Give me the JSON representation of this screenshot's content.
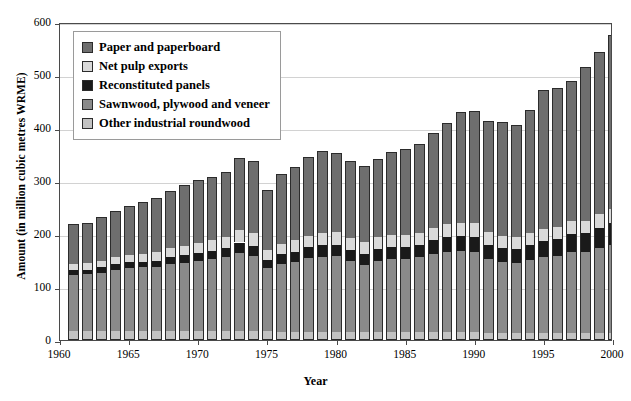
{
  "chart_data": {
    "type": "bar",
    "stacked": true,
    "title": "",
    "xlabel": "Year",
    "ylabel": "Amount (in million cubic metres WRME)",
    "ylim": [
      0,
      600
    ],
    "yticks": [
      0,
      100,
      200,
      300,
      400,
      500,
      600
    ],
    "xlim": [
      1960,
      2000
    ],
    "xticks": [
      1960,
      1965,
      1970,
      1975,
      1980,
      1985,
      1990,
      1995,
      2000
    ],
    "grid": true,
    "legend_position": "upper left",
    "legend_order_top_to_bottom": [
      "Paper and paperboard",
      "Net pulp exports",
      "Reconstituted panels",
      "Sawnwood, plywood and veneer",
      "Other industrial roundwood"
    ],
    "colors": {
      "Paper and paperboard": "#6e6e6e",
      "Net pulp exports": "#d9d9d9",
      "Reconstituted panels": "#1a1a1a",
      "Sawnwood, plywood and veneer": "#8a8a8a",
      "Other industrial roundwood": "#c2c2c2",
      "axis": "#4a4a4a",
      "grid": "#d2d2d2",
      "background": "#ffffff"
    },
    "categories": [
      1961,
      1962,
      1963,
      1964,
      1965,
      1966,
      1967,
      1968,
      1969,
      1970,
      1971,
      1972,
      1973,
      1974,
      1975,
      1976,
      1977,
      1978,
      1979,
      1980,
      1981,
      1982,
      1983,
      1984,
      1985,
      1986,
      1987,
      1988,
      1989,
      1990,
      1991,
      1992,
      1993,
      1994,
      1995,
      1996,
      1997,
      1998,
      1999,
      2000
    ],
    "series": [
      {
        "name": "Other industrial roundwood",
        "values": [
          17,
          17,
          17,
          17,
          17,
          17,
          17,
          17,
          17,
          17,
          17,
          17,
          17,
          17,
          17,
          16,
          16,
          16,
          16,
          16,
          16,
          16,
          15,
          15,
          15,
          15,
          15,
          15,
          15,
          15,
          14,
          14,
          14,
          14,
          14,
          14,
          14,
          14,
          14,
          14
        ]
      },
      {
        "name": "Sawnwood, plywood and veneer",
        "values": [
          106,
          107,
          110,
          116,
          119,
          120,
          121,
          126,
          129,
          132,
          135,
          140,
          148,
          142,
          118,
          128,
          132,
          138,
          141,
          142,
          133,
          126,
          134,
          138,
          138,
          141,
          147,
          152,
          153,
          151,
          139,
          133,
          131,
          137,
          142,
          145,
          152,
          152,
          160,
          166
        ]
      },
      {
        "name": "Reconstituted panels",
        "values": [
          9,
          9,
          10,
          10,
          11,
          11,
          12,
          13,
          14,
          15,
          16,
          17,
          19,
          19,
          16,
          18,
          19,
          21,
          22,
          22,
          21,
          20,
          22,
          23,
          23,
          24,
          26,
          28,
          29,
          29,
          27,
          27,
          27,
          29,
          31,
          32,
          34,
          35,
          38,
          41
        ]
      },
      {
        "name": "Net pulp exports",
        "values": [
          12,
          12,
          13,
          13,
          14,
          15,
          16,
          17,
          18,
          19,
          20,
          21,
          23,
          23,
          19,
          20,
          21,
          22,
          23,
          24,
          23,
          22,
          23,
          23,
          22,
          22,
          23,
          24,
          24,
          25,
          24,
          23,
          22,
          22,
          23,
          23,
          24,
          24,
          25,
          26
        ]
      },
      {
        "name": "Paper and paperboard",
        "values": [
          74,
          76,
          82,
          88,
          92,
          97,
          102,
          108,
          114,
          119,
          119,
          122,
          137,
          136,
          113,
          132,
          139,
          148,
          154,
          148,
          145,
          144,
          148,
          155,
          162,
          168,
          179,
          190,
          209,
          212,
          210,
          214,
          211,
          232,
          262,
          262,
          265,
          290,
          307,
          328
        ]
      }
    ],
    "totals": [
      218,
      221,
      232,
      244,
      253,
      260,
      268,
      281,
      292,
      303,
      307,
      317,
      344,
      337,
      283,
      314,
      327,
      345,
      356,
      352,
      338,
      328,
      342,
      354,
      360,
      370,
      390,
      409,
      430,
      432,
      414,
      411,
      405,
      434,
      472,
      476,
      489,
      515,
      544,
      575
    ]
  },
  "legend": {
    "items": [
      {
        "label": "Paper and paperboard",
        "swatch": "#6e6e6e"
      },
      {
        "label": "Net pulp exports",
        "swatch": "#d9d9d9"
      },
      {
        "label": "Reconstituted panels",
        "swatch": "#1a1a1a"
      },
      {
        "label": "Sawnwood, plywood and veneer",
        "swatch": "#8a8a8a"
      },
      {
        "label": "Other industrial roundwood",
        "swatch": "#c2c2c2"
      }
    ]
  }
}
